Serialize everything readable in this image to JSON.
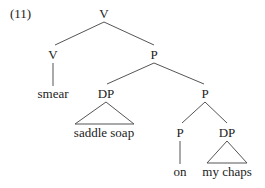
{
  "example_number": "(11)",
  "nodes": {
    "root": "V",
    "v": "V",
    "p1": "P",
    "smear": "smear",
    "dp1": "DP",
    "p2": "P",
    "saddle_soap": "saddle soap",
    "p3": "P",
    "dp2": "DP",
    "on": "on",
    "my_chaps": "my chaps"
  },
  "colors": {
    "line": "#444444",
    "text": "#222222"
  }
}
